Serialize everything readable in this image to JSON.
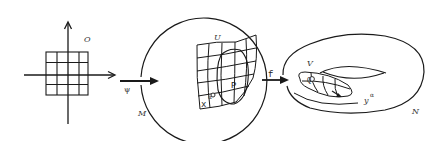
{
  "diagram": {
    "colors": {
      "ink": "#1a1a1a",
      "background": "#ffffff"
    },
    "nodes": {
      "domain": {
        "label": "O",
        "grid": "4x4 square grid on coordinate axes"
      },
      "manifold": {
        "label": "M",
        "region_label": "U",
        "point_label": "P",
        "coord_label": "x",
        "coord_sup": "α"
      },
      "torus": {
        "label": "N",
        "region_label": "V",
        "point_label": "Q",
        "coord_label": "y",
        "coord_sup": "α"
      }
    },
    "edges": [
      {
        "from": "domain",
        "to": "manifold",
        "label": "ψ"
      },
      {
        "from": "manifold",
        "to": "torus",
        "label": "f"
      }
    ]
  }
}
